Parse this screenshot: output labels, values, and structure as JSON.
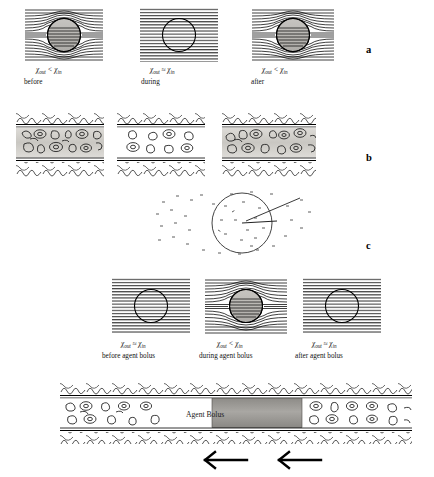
{
  "figure": {
    "panels": [
      {
        "letter": "a",
        "name": "field-distortion-row",
        "cells": [
          {
            "chi": "χout < χin",
            "chi_out": "χ",
            "sub_out": "out",
            "rel": "<",
            "chi_in": "χ",
            "sub_in": "in",
            "state": "before",
            "filled": true,
            "distorted": true
          },
          {
            "chi": "χout ≈ χin",
            "chi_out": "χ",
            "sub_out": "out",
            "rel": "≈",
            "chi_in": "χ",
            "sub_in": "in",
            "state": "during",
            "filled": false,
            "distorted": false
          },
          {
            "chi": "χout < χin",
            "chi_out": "χ",
            "sub_out": "out",
            "rel": "<",
            "chi_in": "χ",
            "sub_in": "in",
            "state": "after",
            "filled": true,
            "distorted": true
          }
        ]
      },
      {
        "letter": "b",
        "name": "vessel-row",
        "cells": [
          {
            "lumen_shaded": true
          },
          {
            "lumen_shaded": false
          },
          {
            "lumen_shaded": true
          }
        ]
      },
      {
        "letter": "c",
        "name": "diffusion-panel",
        "description": "spins diffusing around a vessel cross-section"
      }
    ],
    "lower_row": {
      "name": "agent-bolus-field-row",
      "cells": [
        {
          "chi_out": "χ",
          "sub_out": "out",
          "rel": "≈",
          "chi_in": "χ",
          "sub_in": "in",
          "state": "before agent bolus",
          "filled": false,
          "distorted": false
        },
        {
          "chi_out": "χ",
          "sub_out": "out",
          "rel": "<",
          "chi_in": "χ",
          "sub_in": "in",
          "state": "during agent bolus",
          "filled": true,
          "distorted": true
        },
        {
          "chi_out": "χ",
          "sub_out": "out",
          "rel": "≈",
          "chi_in": "χ",
          "sub_in": "in",
          "state": "after agent bolus",
          "filled": false,
          "distorted": false
        }
      ]
    },
    "bottom_vessel": {
      "name": "long-vessel-with-bolus",
      "bolus_label": "Agent Bolus",
      "flow_arrows": 2,
      "arrow_direction": "left"
    },
    "colors": {
      "ink": "#000000",
      "bolus_fill": "#9a9a9a",
      "lumen_shade": "#cfcdc9",
      "circle_fill": "#b8b6b2"
    }
  }
}
